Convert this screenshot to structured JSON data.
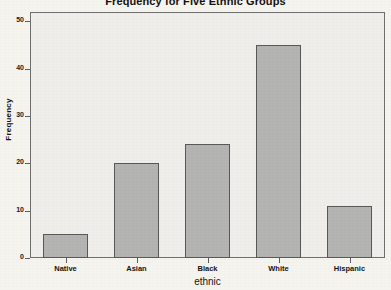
{
  "chart_data": {
    "type": "bar",
    "title": "Frequency for Five Ethnic Groups",
    "xlabel": "ethnic",
    "ylabel": "Frequency",
    "categories": [
      "Native",
      "Asian",
      "Black",
      "White",
      "Hispanic"
    ],
    "values": [
      5,
      20,
      24,
      45,
      11
    ],
    "ylim": [
      0,
      52
    ],
    "yticks": [
      0,
      10,
      20,
      30,
      40,
      50
    ],
    "ytick_labels": [
      "0",
      "10",
      "20",
      "30",
      "40",
      "50"
    ],
    "grid": false,
    "legend": false,
    "colors": {
      "bar_fill": "#b4b4b2",
      "bar_edge": "#585858",
      "plot_background": "#efeeea",
      "page_background": "#f6f4ef",
      "frame": "#6f6f6f",
      "text": "#131313"
    }
  }
}
